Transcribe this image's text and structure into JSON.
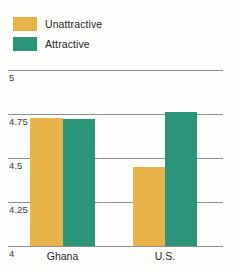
{
  "chart_data": {
    "type": "bar",
    "title": "",
    "subtitle": "",
    "xlabel": "",
    "ylabel": "",
    "categories": [
      "Ghana",
      "U.S."
    ],
    "series": [
      {
        "name": "Unattractive",
        "color": "#e8b44a",
        "values": [
          4.73,
          4.45
        ]
      },
      {
        "name": "Attractive",
        "color": "#2a9579",
        "values": [
          4.72,
          4.76
        ]
      }
    ],
    "ylim": [
      4,
      5
    ],
    "yticks": [
      "4",
      "4.25",
      "4.5",
      "4.75",
      "5"
    ],
    "ytick_values": [
      4,
      4.25,
      4.5,
      4.75,
      5
    ],
    "grid": true,
    "legend_position": "top-left"
  },
  "legend": {
    "items": [
      {
        "label": "Unattractive",
        "color": "#e8b44a"
      },
      {
        "label": "Attractive",
        "color": "#2a9579"
      }
    ]
  },
  "axis": {
    "y_labels": [
      "5",
      "4.75",
      "4.5",
      "4.25",
      "4"
    ],
    "x_labels": [
      "Ghana",
      "U.S."
    ]
  },
  "colors": {
    "unattractive": "#e8b44a",
    "attractive": "#2a9579",
    "gridline": "#8d8f92",
    "text": "#231f20",
    "background": "#fdfdfb"
  }
}
